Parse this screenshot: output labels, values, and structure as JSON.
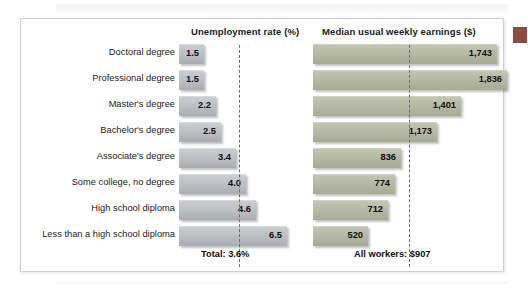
{
  "figure": {
    "headers": {
      "unemployment": "Unemployment rate (%)",
      "earnings": "Median usual weekly earnings ($)"
    },
    "footers": {
      "unemployment": "Total: 3.6%",
      "earnings": "All workers: $907"
    }
  },
  "colors": {
    "unemployment_bar": "#bdc1c6",
    "earnings_bar": "#b6baa4",
    "reference_line": "#6d6d6d",
    "frame": "#cfcfcf",
    "corner_mark": "#8e4b43"
  },
  "rows": [
    {
      "label": "Doctoral degree",
      "unemployment": "1.5",
      "earnings": "1,743"
    },
    {
      "label": "Professional degree",
      "unemployment": "1.5",
      "earnings": "1,836"
    },
    {
      "label": "Master's degree",
      "unemployment": "2.2",
      "earnings": "1,401"
    },
    {
      "label": "Bachelor's degree",
      "unemployment": "2.5",
      "earnings": "1,173"
    },
    {
      "label": "Associate's degree",
      "unemployment": "3.4",
      "earnings": "836"
    },
    {
      "label": "Some college, no degree",
      "unemployment": "4.0",
      "earnings": "774"
    },
    {
      "label": "High school diploma",
      "unemployment": "4.6",
      "earnings": "712"
    },
    {
      "label": "Less than a high school diploma",
      "unemployment": "6.5",
      "earnings": "520"
    }
  ],
  "chart_data": {
    "type": "bar",
    "title": "",
    "orientation": "horizontal",
    "grid": false,
    "legend": null,
    "categories": [
      "Doctoral degree",
      "Professional degree",
      "Master's degree",
      "Bachelor's degree",
      "Associate's degree",
      "Some college, no degree",
      "High school diploma",
      "Less than a high school diploma"
    ],
    "panels": [
      {
        "name": "unemployment",
        "xlabel": "Unemployment rate (%)",
        "ylabel": "",
        "values": [
          1.5,
          1.5,
          2.2,
          2.5,
          3.4,
          4.0,
          4.6,
          6.5
        ],
        "xlim": [
          0,
          7.0
        ],
        "reference_line": {
          "value": 3.6,
          "label": "Total: 3.6%",
          "style": "dashed"
        }
      },
      {
        "name": "earnings",
        "xlabel": "Median usual weekly earnings ($)",
        "ylabel": "",
        "values": [
          1743,
          1836,
          1401,
          1173,
          836,
          774,
          712,
          520
        ],
        "xlim": [
          0,
          2000
        ],
        "reference_line": {
          "value": 907,
          "label": "All workers: $907",
          "style": "dashed"
        }
      }
    ]
  }
}
